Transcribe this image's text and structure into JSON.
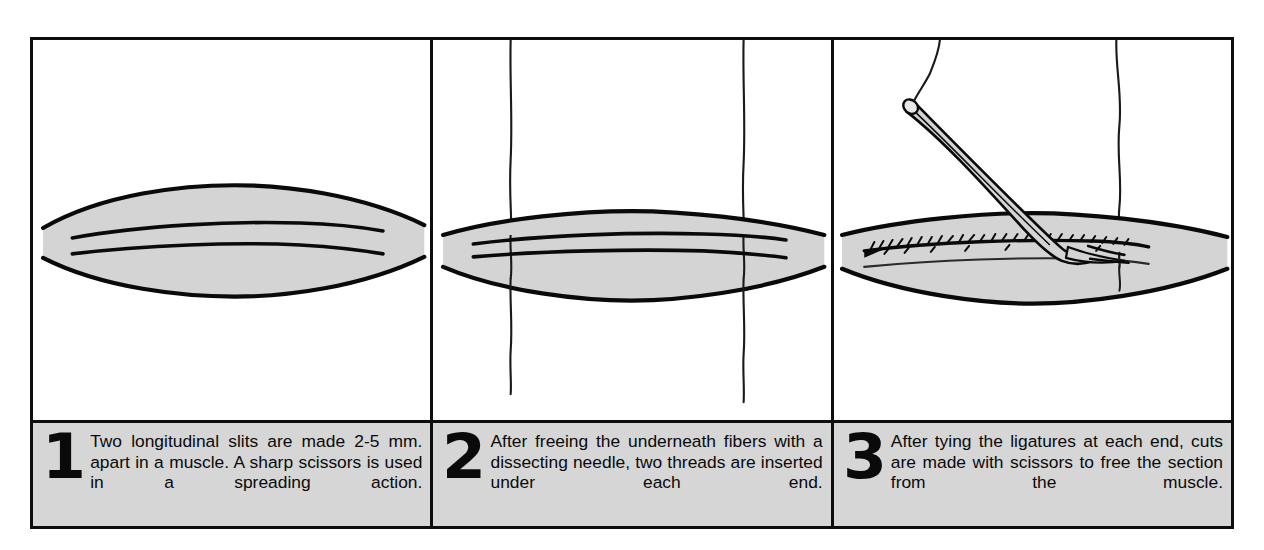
{
  "figure": {
    "border_color": "#0d0d0d",
    "caption_band_color": "#d6d6d6",
    "muscle_fill_color": "#d4d4d4",
    "ink_color": "#0a0a0a",
    "background_color": "#ffffff"
  },
  "panels": [
    {
      "number": "1",
      "caption": "Two longitudinal slits are made 2-5 mm. apart in a muscle. A sharp scissors is used in a spreading action.",
      "illustration_name": "muscle-with-two-longitudinal-slits"
    },
    {
      "number": "2",
      "caption": "After freeing the underneath fibers with a dissecting needle, two threads are inserted under each end.",
      "illustration_name": "muscle-with-two-threads-inserted"
    },
    {
      "number": "3",
      "caption": "After tying the ligatures at each end, cuts are made with scissors to free the section from the muscle.",
      "illustration_name": "muscle-strip-cut-with-scissors"
    }
  ]
}
